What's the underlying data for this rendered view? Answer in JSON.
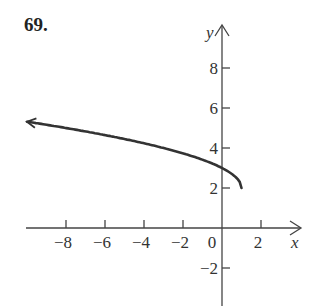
{
  "problem": {
    "number": "69."
  },
  "chart_data": {
    "type": "line",
    "title": "",
    "xlabel": "x",
    "ylabel": "y",
    "function_description": "y = 2 + sqrt(1 - x), drawn from endpoint (1, 2) extending left with arrow",
    "series": [
      {
        "name": "curve",
        "x": [
          1,
          0.75,
          0,
          -1,
          -2,
          -3,
          -4,
          -6,
          -8,
          -10
        ],
        "y": [
          2,
          2.5,
          3,
          3.41,
          3.73,
          4,
          4.24,
          4.65,
          5,
          5.3
        ]
      }
    ],
    "endpoint": {
      "x": 1,
      "y": 2,
      "closed": true
    },
    "arrow_direction": "left",
    "xticks": [
      -8,
      -6,
      -4,
      -2,
      0,
      2
    ],
    "yticks": [
      8,
      6,
      4,
      2,
      -2
    ],
    "xlim": [
      -10.2,
      3.8
    ],
    "ylim": [
      -3.9,
      10
    ],
    "grid": false,
    "labels": {
      "xticks": [
        "−8",
        "−6",
        "−4",
        "−2",
        "0",
        "2"
      ],
      "yticks": [
        "8",
        "6",
        "4",
        "2",
        "−2"
      ]
    }
  }
}
